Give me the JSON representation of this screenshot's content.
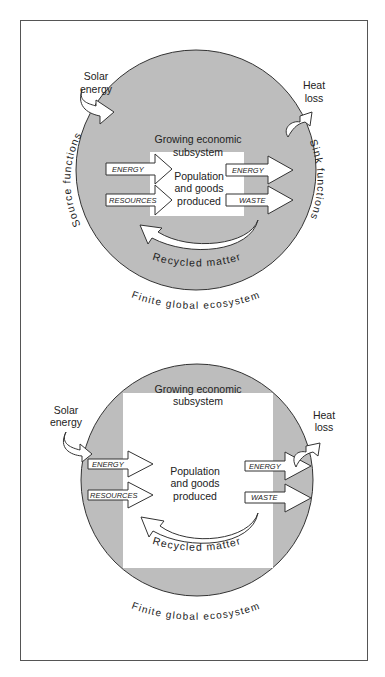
{
  "colors": {
    "ecosystem_fill": "#bdbdbd",
    "economy_fill": "#ffffff",
    "stroke": "#333333",
    "text": "#222222"
  },
  "panels": [
    {
      "id": "top",
      "title": "Growing economic subsystem",
      "economy_title_line1": "Growing economic",
      "economy_title_line2": "subsystem",
      "center_line1": "Population",
      "center_line2": "and goods",
      "center_line3": "produced",
      "inputs": [
        "ENERGY",
        "RESOURCES"
      ],
      "outputs": [
        "ENERGY",
        "WASTE"
      ],
      "solar_line1": "Solar",
      "solar_line2": "energy",
      "heat_line1": "Heat",
      "heat_line2": "loss",
      "source_label": "Source functions",
      "sink_label": "Sink functions",
      "recycled_label": "Recycled matter",
      "ecosystem_label": "Finite global ecosystem"
    },
    {
      "id": "bottom",
      "economy_title_line1": "Growing economic",
      "economy_title_line2": "subsystem",
      "center_line1": "Population",
      "center_line2": "and goods",
      "center_line3": "produced",
      "inputs": [
        "ENERGY",
        "RESOURCES"
      ],
      "outputs": [
        "ENERGY",
        "WASTE"
      ],
      "solar_line1": "Solar",
      "solar_line2": "energy",
      "heat_line1": "Heat",
      "heat_line2": "loss",
      "recycled_label": "Recycled matter",
      "ecosystem_label": "Finite global ecosystem"
    }
  ]
}
